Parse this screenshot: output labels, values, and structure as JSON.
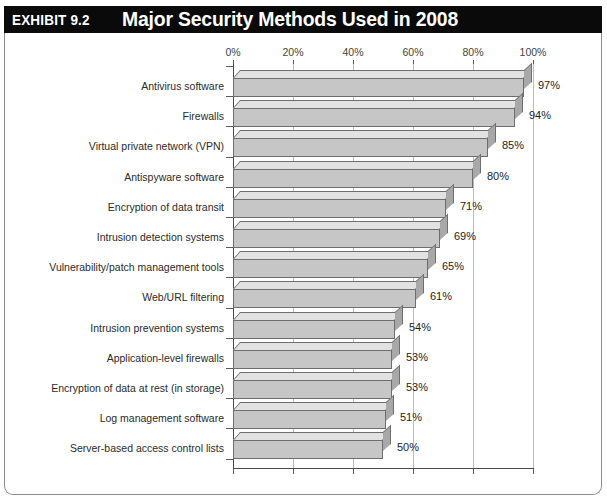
{
  "header": {
    "exhibit_tag": "EXHIBIT 9.2",
    "title": "Major Security Methods Used in 2008"
  },
  "chart_data": {
    "type": "bar",
    "orientation": "horizontal",
    "title": "Major Security Methods Used in 2008",
    "xlabel": "",
    "ylabel": "",
    "xlim": [
      0,
      100
    ],
    "grid": true,
    "legend": "none",
    "tick_labels": [
      "0%",
      "20%",
      "40%",
      "60%",
      "80%",
      "100%"
    ],
    "ticks": [
      0,
      20,
      40,
      60,
      80,
      100
    ],
    "categories": [
      "Antivirus software",
      "Firewalls",
      "Virtual private network (VPN)",
      "Antispyware software",
      "Encryption of data transit",
      "Intrusion detection systems",
      "Vulnerability/patch management tools",
      "Web/URL filtering",
      "Intrusion prevention systems",
      "Application-level firewalls",
      "Encryption of data at rest (in storage)",
      "Log management software",
      "Server-based access control lists"
    ],
    "values": [
      97,
      94,
      85,
      80,
      71,
      69,
      65,
      61,
      54,
      53,
      53,
      51,
      50
    ],
    "value_labels": [
      "97%",
      "94%",
      "85%",
      "80%",
      "71%",
      "69%",
      "65%",
      "61%",
      "54%",
      "53%",
      "53%",
      "51%",
      "50%"
    ],
    "colors": {
      "bar_face": "#c6c6c6",
      "bar_top": "#e2e2e2",
      "bar_side": "#a8a8a8",
      "bar_edge": "#6e6e6e",
      "header_bg": "#0a0a0a",
      "header_text": "#ffffff",
      "axis": "#4a4a4a",
      "grid": "#bcbcbc"
    }
  }
}
